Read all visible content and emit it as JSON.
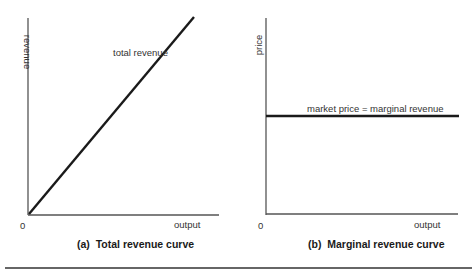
{
  "chart_data": [
    {
      "type": "line",
      "panel": "a",
      "caption": "(a)  Total revenue curve",
      "xlabel": "output",
      "ylabel": "revenue",
      "origin_label": "0",
      "series": [
        {
          "name": "total revenue",
          "x": [
            0,
            1
          ],
          "y": [
            0,
            1
          ]
        }
      ],
      "annotation": "total revenue",
      "grid": false
    },
    {
      "type": "line",
      "panel": "b",
      "caption": "(b)  Marginal revenue curve",
      "xlabel": "output",
      "ylabel": "price",
      "origin_label": "0",
      "series": [
        {
          "name": "market price = marginal revenue",
          "x": [
            0,
            1
          ],
          "y": [
            0.5,
            0.5
          ]
        }
      ],
      "annotation": "market price = marginal revenue",
      "grid": false
    }
  ],
  "colors": {
    "line": "#1a1a1a",
    "axis": "#444444",
    "rule": "#333333"
  }
}
